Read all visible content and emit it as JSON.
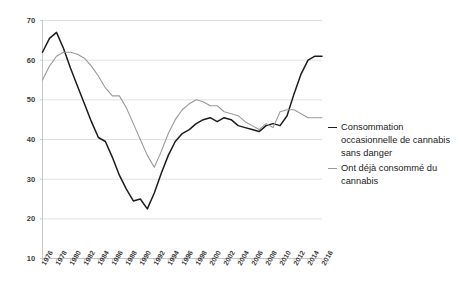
{
  "chart_data": {
    "type": "line",
    "title": "",
    "subtitle": "",
    "xlabel": "",
    "ylabel": "",
    "xlim": [
      1976,
      2016
    ],
    "ylim": [
      10,
      70
    ],
    "ytick_values": [
      10,
      20,
      30,
      40,
      50,
      60,
      70
    ],
    "ytick_labels": [
      "10",
      "20",
      "30",
      "40",
      "50",
      "60",
      "70"
    ],
    "xtick_values": [
      1976,
      1978,
      1980,
      1982,
      1984,
      1986,
      1988,
      1990,
      1992,
      1994,
      1996,
      1998,
      2000,
      2002,
      2004,
      2006,
      2008,
      2010,
      2012,
      2014,
      2016
    ],
    "xtick_labels": [
      "1976",
      "1978",
      "1980",
      "1982",
      "1984",
      "1986",
      "1988",
      "1990",
      "1992",
      "1994",
      "1996",
      "1998",
      "2000",
      "2002",
      "2004",
      "2006",
      "2008",
      "2010",
      "2012",
      "2014",
      "2016"
    ],
    "grid": "horizontal",
    "legend_position": "right",
    "x": [
      1976,
      1977,
      1978,
      1979,
      1980,
      1981,
      1982,
      1983,
      1984,
      1985,
      1986,
      1987,
      1988,
      1989,
      1990,
      1991,
      1992,
      1993,
      1994,
      1995,
      1996,
      1997,
      1998,
      1999,
      2000,
      2001,
      2002,
      2003,
      2004,
      2005,
      2006,
      2007,
      2008,
      2009,
      2010,
      2011,
      2012,
      2013,
      2014,
      2015,
      2016
    ],
    "series": [
      {
        "name": "Consommation occasionnelle de cannabis sans danger",
        "color": "#1c1c1c",
        "values": [
          62.0,
          65.5,
          67.0,
          63.0,
          58.0,
          53.5,
          49.0,
          44.5,
          40.5,
          39.5,
          35.5,
          31.0,
          27.5,
          24.5,
          25.0,
          22.5,
          26.5,
          31.5,
          36.0,
          39.5,
          41.5,
          42.5,
          44.0,
          45.0,
          45.5,
          44.5,
          45.5,
          45.0,
          43.5,
          43.0,
          42.5,
          42.0,
          43.5,
          44.0,
          43.5,
          46.0,
          51.5,
          56.5,
          60.0,
          61.0,
          61.0
        ]
      },
      {
        "name": "Ont déjà consommé du cannabis",
        "color": "#9a9a9a",
        "values": [
          55.0,
          58.5,
          61.0,
          62.0,
          62.0,
          61.5,
          60.5,
          58.5,
          56.0,
          53.0,
          51.0,
          51.0,
          48.0,
          44.0,
          40.0,
          36.0,
          33.0,
          37.0,
          41.5,
          45.0,
          47.5,
          49.0,
          50.0,
          49.5,
          48.5,
          48.5,
          47.0,
          46.5,
          46.0,
          44.5,
          43.5,
          42.5,
          44.0,
          43.0,
          47.0,
          47.5,
          47.5,
          46.5,
          45.5,
          45.5,
          45.5
        ]
      }
    ]
  },
  "legend": {
    "entries": [
      {
        "label": "Consommation occasionnelle de cannabis sans danger",
        "color": "#1c1c1c"
      },
      {
        "label": "Ont déjà consommé du cannabis",
        "color": "#9a9a9a"
      }
    ]
  }
}
